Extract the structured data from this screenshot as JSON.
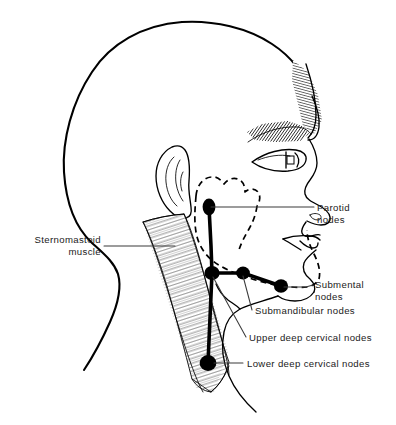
{
  "figure": {
    "background_color": "#ffffff",
    "ink_color": "#000000",
    "leader_color": "#3a3a3a",
    "width": 396,
    "height": 425
  },
  "labels": {
    "sternomastoid_line1": "Sternomastoid",
    "sternomastoid_line2": "muscle",
    "parotid_line1": "Parotid",
    "parotid_line2": "nodes",
    "submental_line1": "Submental",
    "submental_line2": "nodes",
    "submandibular": "Submandibular  nodes",
    "upper_deep_cervical": "Upper  deep  cervical  nodes",
    "lower_deep_cervical": "Lower  deep  cervical  nodes"
  },
  "node_groups": [
    {
      "name": "parotid-node",
      "cx": 209,
      "cy": 207,
      "rx": 6.4,
      "ry": 8.2
    },
    {
      "name": "upper-deep-cervical-node",
      "cx": 212,
      "cy": 273,
      "rx": 7.4,
      "ry": 7.0
    },
    {
      "name": "submandibular-node",
      "cx": 243,
      "cy": 273,
      "rx": 6.8,
      "ry": 6.4
    },
    {
      "name": "submental-node",
      "cx": 281,
      "cy": 286,
      "rx": 7.0,
      "ry": 6.6
    },
    {
      "name": "lower-deep-cervical-node",
      "cx": 208,
      "cy": 363,
      "rx": 8.2,
      "ry": 7.8
    }
  ],
  "anatomy": {
    "sternomastoid_muscle": "hatched diagonal band descending from mastoid to clavicle",
    "parotid_outline": "dashed contour of parotid gland and mandible border",
    "ear": "auricle with helix and antihelix",
    "eyebrow": "stippled/hatched brow",
    "hairline": "shaded forehead brow ridge"
  }
}
